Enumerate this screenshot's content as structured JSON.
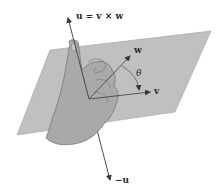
{
  "diagram": {
    "type": "right-hand rule for cross product",
    "labels": {
      "u_axis": "u = v × w",
      "w_vector": "w",
      "v_vector": "v",
      "angle": "θ",
      "neg_u_axis": "−u"
    },
    "colors": {
      "plane_fill": "#b9b9b9",
      "plane_edge": "#9a9a9a",
      "hand_fill": "#a8a8a8",
      "hand_outline": "#6e6e6e",
      "axis_line": "#3a3a3a",
      "vector": "#4a4a4a",
      "text": "#2a2a2a"
    }
  }
}
